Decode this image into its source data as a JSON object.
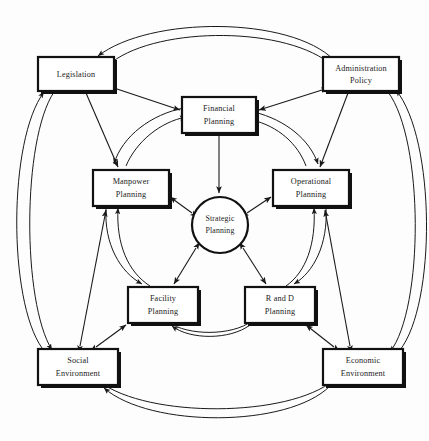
{
  "diagram": {
    "type": "network-diagram",
    "background_color": "#fdfdfd",
    "line_color": "#1a1a1a",
    "box_fill": "#ffffff",
    "canvas": {
      "width": 429,
      "height": 441
    },
    "center": {
      "id": "strategic-planning",
      "label_line1": "Strategic",
      "label_line2": "Planning",
      "shape": "circle",
      "cx": 220,
      "cy": 225,
      "r": 28
    },
    "inner_nodes": [
      {
        "id": "financial-planning",
        "label_line1": "Financial",
        "label_line2": "Planning",
        "x": 182,
        "y": 97,
        "w": 74,
        "h": 36
      },
      {
        "id": "operational-planning",
        "label_line1": "Operational",
        "label_line2": "Planning",
        "x": 273,
        "y": 170,
        "w": 76,
        "h": 36
      },
      {
        "id": "r-and-d-planning",
        "label_line1": "R and D",
        "label_line2": "Planning",
        "x": 245,
        "y": 287,
        "w": 70,
        "h": 36
      },
      {
        "id": "facility-planning",
        "label_line1": "Facility",
        "label_line2": "Planning",
        "x": 128,
        "y": 287,
        "w": 70,
        "h": 36
      },
      {
        "id": "manpower-planning",
        "label_line1": "Manpower",
        "label_line2": "Planning",
        "x": 93,
        "y": 170,
        "w": 76,
        "h": 36
      }
    ],
    "outer_nodes": [
      {
        "id": "legislation",
        "label_line1": "Legislation",
        "label_line2": "",
        "x": 38,
        "y": 57,
        "w": 76,
        "h": 34
      },
      {
        "id": "administration-policy",
        "label_line1": "Administration",
        "label_line2": "Policy",
        "x": 323,
        "y": 57,
        "w": 76,
        "h": 34
      },
      {
        "id": "economic-environment",
        "label_line1": "Economic",
        "label_line2": "Environment",
        "x": 323,
        "y": 349,
        "w": 80,
        "h": 36
      },
      {
        "id": "social-environment",
        "label_line1": "Social",
        "label_line2": "Environment",
        "x": 38,
        "y": 349,
        "w": 80,
        "h": 36
      }
    ],
    "relations": [
      {
        "from": "strategic-planning",
        "to": "financial-planning",
        "style": "single-arrow-inward"
      },
      {
        "from": "strategic-planning",
        "to": "operational-planning",
        "style": "double-arrow"
      },
      {
        "from": "strategic-planning",
        "to": "r-and-d-planning",
        "style": "double-arrow"
      },
      {
        "from": "strategic-planning",
        "to": "facility-planning",
        "style": "double-arrow"
      },
      {
        "from": "strategic-planning",
        "to": "manpower-planning",
        "style": "double-arrow"
      },
      {
        "from": "financial-planning",
        "to": "manpower-planning",
        "style": "arc-pair"
      },
      {
        "from": "financial-planning",
        "to": "operational-planning",
        "style": "arc-pair"
      },
      {
        "from": "manpower-planning",
        "to": "facility-planning",
        "style": "arc-pair"
      },
      {
        "from": "operational-planning",
        "to": "r-and-d-planning",
        "style": "arc-pair"
      },
      {
        "from": "facility-planning",
        "to": "r-and-d-planning",
        "style": "arc-pair"
      },
      {
        "from": "legislation",
        "to": "financial-planning",
        "style": "double-arrow"
      },
      {
        "from": "legislation",
        "to": "manpower-planning",
        "style": "double-arrow"
      },
      {
        "from": "administration-policy",
        "to": "financial-planning",
        "style": "double-arrow"
      },
      {
        "from": "administration-policy",
        "to": "operational-planning",
        "style": "double-arrow"
      },
      {
        "from": "economic-environment",
        "to": "operational-planning",
        "style": "double-arrow"
      },
      {
        "from": "economic-environment",
        "to": "r-and-d-planning",
        "style": "double-arrow"
      },
      {
        "from": "social-environment",
        "to": "facility-planning",
        "style": "double-arrow"
      },
      {
        "from": "social-environment",
        "to": "manpower-planning",
        "style": "double-arrow"
      },
      {
        "from": "legislation",
        "to": "administration-policy",
        "style": "outer-arc-pair"
      },
      {
        "from": "administration-policy",
        "to": "economic-environment",
        "style": "outer-arc-pair"
      },
      {
        "from": "economic-environment",
        "to": "social-environment",
        "style": "outer-arc-pair"
      },
      {
        "from": "social-environment",
        "to": "legislation",
        "style": "outer-arc-pair"
      }
    ]
  }
}
